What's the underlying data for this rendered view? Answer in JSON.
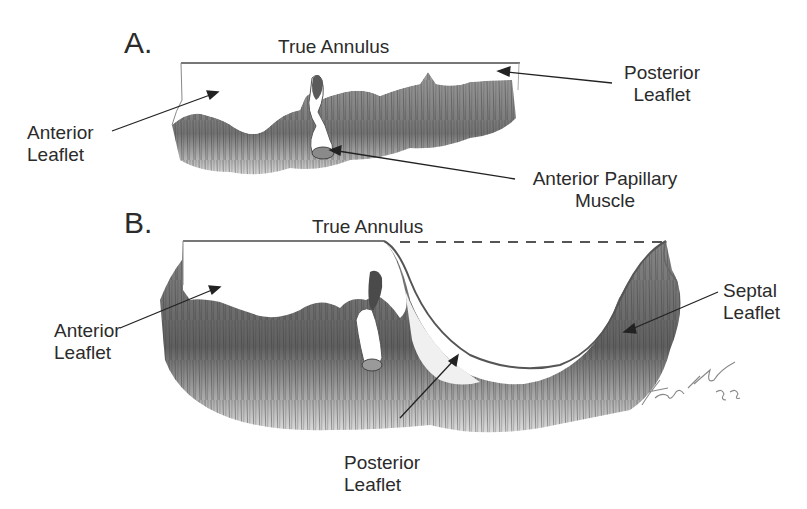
{
  "figure": {
    "panels": [
      {
        "id": "A",
        "panel_label": "A.",
        "annulus_label": "True Annulus",
        "labels": {
          "posterior_leaflet": [
            "Posterior",
            "Leaflet"
          ],
          "anterior_leaflet": [
            "Anterior",
            "Leaflet"
          ],
          "anterior_papillary_muscle": [
            "Anterior Papillary",
            "Muscle"
          ]
        }
      },
      {
        "id": "B",
        "panel_label": "B.",
        "annulus_label": "True Annulus",
        "labels": {
          "anterior_leaflet": [
            "Anterior",
            "Leaflet"
          ],
          "septal_leaflet": [
            "Septal",
            "Leaflet"
          ],
          "posterior_leaflet": [
            "Posterior",
            "Leaflet"
          ]
        }
      }
    ],
    "signature": "Frank H '85",
    "colors": {
      "ink": "#2b2b2b",
      "shade_dark": "#555555",
      "shade_light": "#bdbdbd",
      "background": "#ffffff"
    }
  }
}
